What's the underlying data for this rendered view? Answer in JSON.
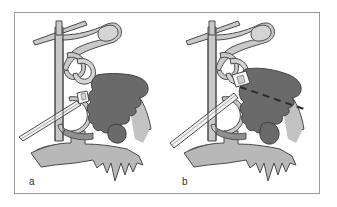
{
  "figure": {
    "type": "medical-illustration",
    "background_color": "#ffffff",
    "frame_color": "#9a9a9a",
    "panels": [
      {
        "id": "a",
        "label": "a",
        "caption_letter": "a",
        "description": "Endoscopic instrument tip positioned at the middle meatus adjacent to a dark shaded lesion in the maxillary sinus",
        "elements": {
          "instrument": "straight-cannula",
          "lesion": "dark-gray-mass",
          "mucosa": "light-gray-fill",
          "guide_line": "none"
        }
      },
      {
        "id": "b",
        "label": "b",
        "caption_letter": "b",
        "description": "Instrument advanced with dashed trajectory line extending through the antrostomy into the maxillary sinus lesion",
        "elements": {
          "instrument": "straight-cannula",
          "lesion": "dark-gray-mass",
          "mucosa": "light-gray-fill",
          "guide_line": "dashed-trajectory"
        }
      }
    ],
    "colors": {
      "lesion_fill": "#6a6a6a",
      "mucosa_fill": "#b8b8b8",
      "bone_fill": "#c9c9c9",
      "outline": "#4a4a4a",
      "instrument_fill": "#f2f2f2",
      "label_text": "#303030",
      "dashed_line": "#2b2b2b"
    }
  }
}
